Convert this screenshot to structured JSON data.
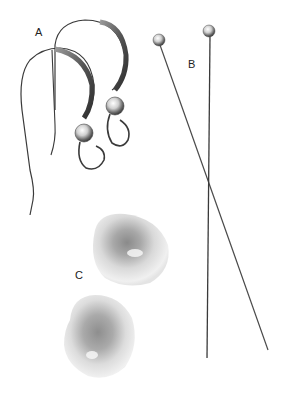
{
  "image": {
    "description": "Jewelry making supplies on white background",
    "background": "#ffffff"
  },
  "labels": {
    "a": "A",
    "b": "B",
    "c": "C"
  },
  "items": [
    {
      "key": "A",
      "name": "ear wires",
      "count": 2
    },
    {
      "key": "B",
      "name": "headpins",
      "count": 2
    },
    {
      "key": "C",
      "name": "pearls",
      "count": 2
    }
  ],
  "colors": {
    "metal_dark": "#3a3a3a",
    "metal_mid": "#7a7a7a",
    "metal_light": "#d8d8d8",
    "pearl_light": "#f2f2f2",
    "pearl_shadow": "#8c8c8c",
    "label_text": "#222222"
  }
}
